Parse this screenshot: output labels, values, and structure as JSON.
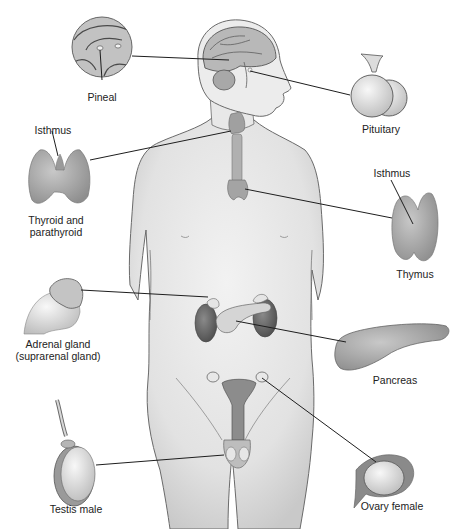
{
  "diagram": {
    "labels": {
      "pineal": "Pineal",
      "pituitary": "Pituitary",
      "thyroid_isthmus": "Isthmus",
      "thyroid": "Thyroid and\nparathyroid",
      "thymus_isthmus": "Isthmus",
      "thymus": "Thymus",
      "adrenal": "Adrenal gland\n(suprarenal gland)",
      "pancreas": "Pancreas",
      "testis": "Testis male",
      "ovary": "Ovary female"
    },
    "colors": {
      "background": "#ffffff",
      "skin": "#e6e6e6",
      "outline": "#5a5a5a",
      "gland": "#a9a9a9",
      "kidney": "#6e6e6e",
      "leader_line": "#1e1e1e",
      "text": "#222222"
    }
  }
}
